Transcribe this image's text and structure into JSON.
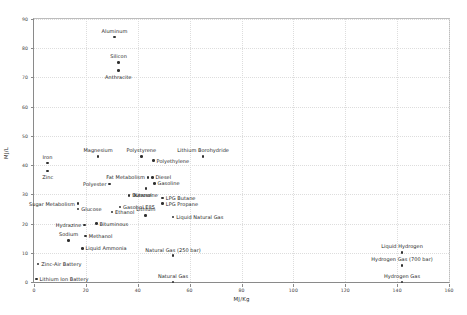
{
  "chart_data": {
    "type": "scatter",
    "title": "",
    "xlabel": "MJ/Kg",
    "ylabel": "MJ/L",
    "xlim": [
      0,
      160
    ],
    "ylim": [
      0,
      90
    ],
    "xticks": [
      0,
      20,
      40,
      60,
      80,
      100,
      120,
      140,
      160
    ],
    "yticks": [
      0,
      10,
      20,
      30,
      40,
      50,
      60,
      70,
      80,
      90
    ],
    "grid": true,
    "legend": "none",
    "points": [
      {
        "label": "Aluminum",
        "x": 31.0,
        "y": 83.8,
        "pos": "above"
      },
      {
        "label": "Silicon",
        "x": 32.6,
        "y": 75.2,
        "pos": "above"
      },
      {
        "label": "Anthracite",
        "x": 32.5,
        "y": 72.4,
        "pos": "below"
      },
      {
        "label": "Magnesium",
        "x": 24.7,
        "y": 43.0,
        "pos": "above"
      },
      {
        "label": "Polystyrene",
        "x": 41.4,
        "y": 43.0,
        "pos": "above"
      },
      {
        "label": "Lithium Borohydride",
        "x": 65.2,
        "y": 43.0,
        "pos": "above"
      },
      {
        "label": "Polyethylene",
        "x": 46.0,
        "y": 41.5,
        "pos": "right"
      },
      {
        "label": "Iron",
        "x": 5.2,
        "y": 40.7,
        "pos": "above"
      },
      {
        "label": "Zinc",
        "x": 5.3,
        "y": 38.0,
        "pos": "below"
      },
      {
        "label": "Diesel",
        "x": 45.6,
        "y": 35.8,
        "pos": "right"
      },
      {
        "label": "Fat Metabolism",
        "x": 44.0,
        "y": 35.8,
        "pos": "left"
      },
      {
        "label": "Gasoline",
        "x": 46.4,
        "y": 33.8,
        "pos": "right"
      },
      {
        "label": "Polyester",
        "x": 29.2,
        "y": 33.6,
        "pos": "left"
      },
      {
        "label": "Kerosene",
        "x": 43.2,
        "y": 32.0,
        "pos": "below"
      },
      {
        "label": "Butanol",
        "x": 36.6,
        "y": 29.7,
        "pos": "right"
      },
      {
        "label": "LPG Butane",
        "x": 49.6,
        "y": 28.7,
        "pos": "right"
      },
      {
        "label": "LPG Propane",
        "x": 49.6,
        "y": 26.8,
        "pos": "right"
      },
      {
        "label": "Sugar Metabolism",
        "x": 17.0,
        "y": 26.8,
        "pos": "left"
      },
      {
        "label": "Gasohol E85",
        "x": 33.1,
        "y": 25.6,
        "pos": "right"
      },
      {
        "label": "Glucose",
        "x": 17.0,
        "y": 25.0,
        "pos": "right"
      },
      {
        "label": "Ethanol",
        "x": 30.0,
        "y": 24.0,
        "pos": "right"
      },
      {
        "label": "Lithium",
        "x": 43.1,
        "y": 22.8,
        "pos": "above"
      },
      {
        "label": "Liquid Natural Gas",
        "x": 53.6,
        "y": 22.2,
        "pos": "right"
      },
      {
        "label": "Bituminous",
        "x": 24.0,
        "y": 20.0,
        "pos": "right"
      },
      {
        "label": "Hydrazine",
        "x": 19.5,
        "y": 19.5,
        "pos": "left"
      },
      {
        "label": "Methanol",
        "x": 19.9,
        "y": 15.8,
        "pos": "right"
      },
      {
        "label": "Sodium",
        "x": 13.3,
        "y": 14.2,
        "pos": "above"
      },
      {
        "label": "Liquid Ammonia",
        "x": 18.6,
        "y": 11.5,
        "pos": "right"
      },
      {
        "label": "Natural Gas (250 bar)",
        "x": 53.6,
        "y": 9.0,
        "pos": "above"
      },
      {
        "label": "Liquid Hydrogen",
        "x": 141.9,
        "y": 10.1,
        "pos": "above"
      },
      {
        "label": "Hydrogen Gas (700 bar)",
        "x": 141.9,
        "y": 5.6,
        "pos": "above"
      },
      {
        "label": "Zinc-Air Battery",
        "x": 1.6,
        "y": 6.1,
        "pos": "right"
      },
      {
        "label": "Lithium Ion Battery",
        "x": 0.9,
        "y": 1.0,
        "pos": "right"
      },
      {
        "label": "Natural Gas",
        "x": 53.6,
        "y": 0.04,
        "pos": "above"
      },
      {
        "label": "Hydrogen Gas",
        "x": 141.9,
        "y": 0.01,
        "pos": "above"
      }
    ]
  }
}
